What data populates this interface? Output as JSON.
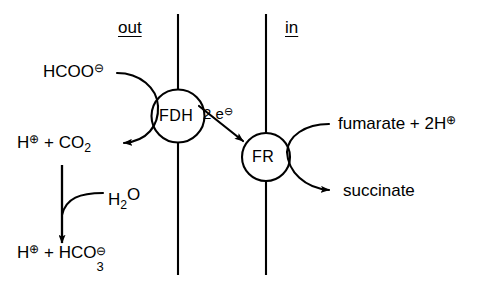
{
  "diagram": {
    "title_out": "out",
    "title_in": "in",
    "enzymes": {
      "fdh": "FDH",
      "fr": "FR"
    },
    "electrons": {
      "count": "2",
      "symbol": "e",
      "charge": "⊖",
      "full": "2 e⊖"
    },
    "substrates": {
      "formate": "HCOO",
      "formate_charge": "⊖",
      "proton": "H",
      "proton_charge": "⊕",
      "plus": "+",
      "carbon_dioxide": "CO",
      "carbon_dioxide_sub": "2",
      "water": "H",
      "water_sub": "2",
      "water_o": "O",
      "bicarbonate": "HCO",
      "bicarbonate_sub": "3",
      "bicarbonate_charge": "⊖",
      "fumarate": "fumarate",
      "fumarate_protons": "2H",
      "fumarate_charge": "⊕",
      "succinate": "succinate"
    },
    "colors": {
      "stroke": "#000000",
      "background": "#ffffff"
    }
  }
}
